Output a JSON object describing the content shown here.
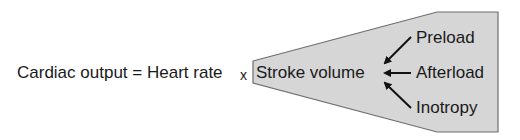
{
  "equation": {
    "lhs": "Cardiac output",
    "equals": "=",
    "term1": "Heart rate",
    "times": "x",
    "term2": "Stroke volume"
  },
  "determinants": [
    {
      "label": "Preload",
      "direction": "down-left"
    },
    {
      "label": "Afterload",
      "direction": "left"
    },
    {
      "label": "Inotropy",
      "direction": "up-left"
    }
  ],
  "colors": {
    "panel_fill": "#d6d6d6",
    "panel_stroke": "#6e6e6e",
    "text": "#1a1a1a",
    "arrow": "#111111"
  }
}
